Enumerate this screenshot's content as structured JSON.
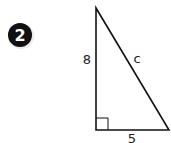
{
  "problem": {
    "number": "2",
    "badge_color": "#111111"
  },
  "triangle": {
    "type": "right-triangle",
    "vertical_leg_label": "8",
    "horizontal_leg_label": "5",
    "hypotenuse_label": "c",
    "right_angle_marker": true,
    "stroke_color": "#111111"
  }
}
